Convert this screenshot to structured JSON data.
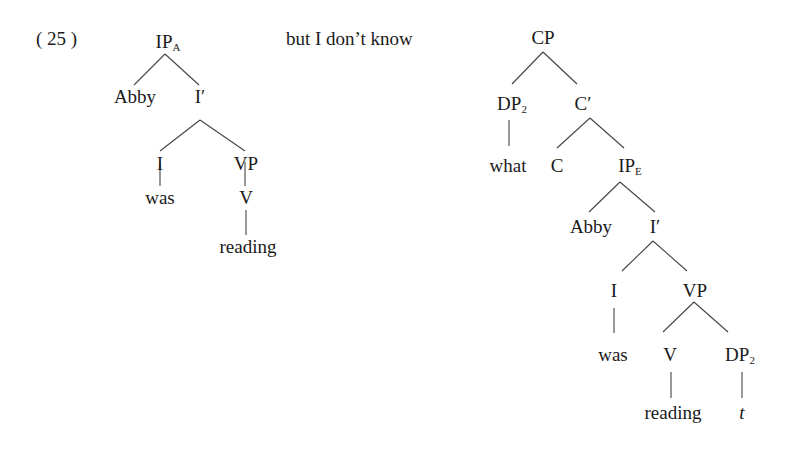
{
  "example_number": "( 25 )",
  "connector_text": "but I don’t know",
  "left_tree": {
    "name": "IP_A",
    "nodes": {
      "ip": {
        "label": "IP",
        "sub": "A"
      },
      "abby": {
        "label": "Abby"
      },
      "ibar": {
        "label": "I′"
      },
      "i": {
        "label": "I"
      },
      "vp": {
        "label": "VP"
      },
      "was": {
        "label": "was"
      },
      "v": {
        "label": "V"
      },
      "reading": {
        "label": "reading"
      }
    }
  },
  "right_tree": {
    "name": "CP",
    "nodes": {
      "cp": {
        "label": "CP"
      },
      "dp": {
        "label": "DP",
        "sub": "2"
      },
      "cbar": {
        "label": "C′"
      },
      "what": {
        "label": "what"
      },
      "c": {
        "label": "C"
      },
      "ip": {
        "label": "IP",
        "sub": "E"
      },
      "abby": {
        "label": "Abby"
      },
      "ibar": {
        "label": "I′"
      },
      "i": {
        "label": "I"
      },
      "vp": {
        "label": "VP"
      },
      "was": {
        "label": "was"
      },
      "v": {
        "label": "V"
      },
      "dp2": {
        "label": "DP",
        "sub": "2"
      },
      "reading": {
        "label": "reading"
      },
      "trace": {
        "label": "t"
      }
    }
  }
}
